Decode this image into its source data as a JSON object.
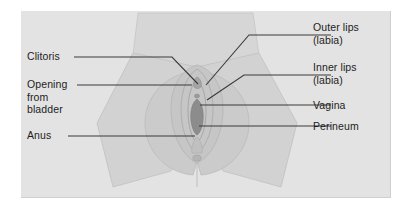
{
  "figure": {
    "panel": {
      "background_color": "#e3e3e3",
      "border_color": "#cfcfcf",
      "page_background": "#ffffff"
    },
    "illustration": {
      "description": "Grayscale line illustration of the vulva viewed from below, between two thighs",
      "fill_light": "#d8d8d8",
      "fill_mid": "#cdcdcd",
      "fill_dark": "#a9a9a9",
      "outline_color": "#b0b0b0",
      "leader_line_color": "#3a3a3a"
    },
    "labels": [
      {
        "id": "clitoris",
        "line1": "Clitoris",
        "line2": "",
        "side": "left",
        "anchor_x": 196,
        "anchor_y": 84
      },
      {
        "id": "opening-from-bladder",
        "line1": "Opening",
        "line2": "from",
        "line3": "bladder",
        "side": "left",
        "anchor_x": 186,
        "anchor_y": 86
      },
      {
        "id": "anus",
        "line1": "Anus",
        "line2": "",
        "side": "left",
        "anchor_x": 195,
        "anchor_y": 136
      },
      {
        "id": "outer-lips",
        "line1": "Outer lips",
        "line2": "(labia)",
        "side": "right",
        "anchor_x": 200,
        "anchor_y": 86
      },
      {
        "id": "inner-lips",
        "line1": "Inner lips",
        "line2": "(labia)",
        "side": "right",
        "anchor_x": 202,
        "anchor_y": 99
      },
      {
        "id": "vagina",
        "line1": "Vagina",
        "line2": "",
        "side": "right",
        "anchor_x": 196,
        "anchor_y": 105
      },
      {
        "id": "perineum",
        "line1": "Perineum",
        "line2": "",
        "side": "right",
        "anchor_x": 205,
        "anchor_y": 126
      }
    ]
  }
}
